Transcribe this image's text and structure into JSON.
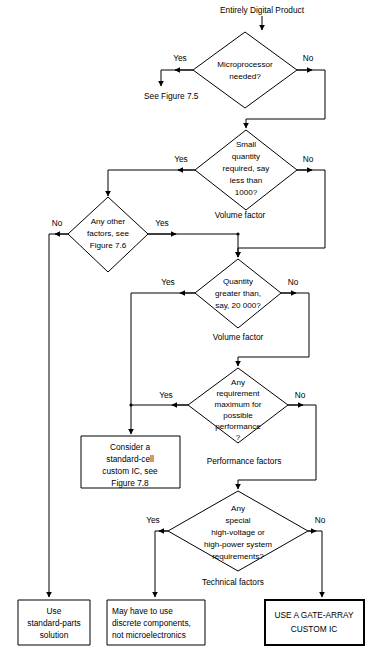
{
  "diagram": {
    "title": "Entirely Digital Product",
    "line_color": "#000000",
    "background_color": "#ffffff",
    "start_label": "Entirely Digital Product",
    "reference_note": "See Figure 7.5",
    "decisions": [
      {
        "id": "microprocessor",
        "lines": [
          "Microprocessor",
          "needed?"
        ],
        "yes_label": "Yes",
        "no_label": "No",
        "factor_label": ""
      },
      {
        "id": "small-quantity",
        "lines": [
          "Small",
          "quantity",
          "required, say",
          "less than",
          "1000?"
        ],
        "yes_label": "Yes",
        "no_label": "No",
        "factor_label": "Volume factor"
      },
      {
        "id": "any-other-factors",
        "lines": [
          "Any other",
          "factors, see",
          "Figure 7.6"
        ],
        "yes_label": "Yes",
        "no_label": "No",
        "factor_label": ""
      },
      {
        "id": "quantity-greater",
        "lines": [
          "Quantity",
          "greater than,",
          "say, 20 000?"
        ],
        "yes_label": "Yes",
        "no_label": "No",
        "factor_label": "Volume factor"
      },
      {
        "id": "performance",
        "lines": [
          "Any",
          "requirement",
          "maximum for",
          "possible",
          "performance",
          "?"
        ],
        "yes_label": "Yes",
        "no_label": "No",
        "factor_label": "Performance factors"
      },
      {
        "id": "technical",
        "lines": [
          "Any",
          "special",
          "high-voltage or",
          "high-power system",
          "requirements?"
        ],
        "yes_label": "Yes",
        "no_label": "No",
        "factor_label": "Technical factors"
      }
    ],
    "boxes": [
      {
        "id": "standard-cell",
        "lines": [
          "Consider a",
          "standard-cell",
          "custom IC, see",
          "Figure 7.8"
        ],
        "emphasis": "normal"
      },
      {
        "id": "standard-parts",
        "lines": [
          "Use",
          "standard-parts",
          "solution"
        ],
        "emphasis": "normal"
      },
      {
        "id": "discrete-components",
        "lines": [
          "May have to use",
          "discrete components,",
          "not microelectronics"
        ],
        "emphasis": "normal"
      },
      {
        "id": "gate-array",
        "lines": [
          "USE A GATE-ARRAY",
          "CUSTOM IC"
        ],
        "emphasis": "bold"
      }
    ]
  }
}
